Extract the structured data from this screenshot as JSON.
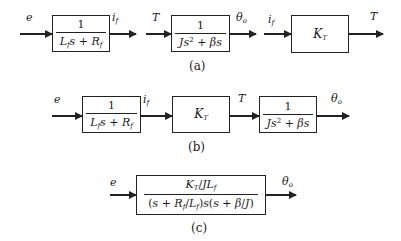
{
  "diagram": {
    "type": "block-diagram",
    "panels": [
      {
        "caption": "(a)",
        "blocks": [
          {
            "id": "a1",
            "numerator": "1",
            "denominator_html": "<i>L<sub>f</sub>s</i> + <i>R<sub>f</sub></i>",
            "input": "e",
            "output": "i_f"
          },
          {
            "id": "a2",
            "numerator": "1",
            "denominator_html": "<i>Js</i><sup>2</sup> + <i>βs</i>",
            "input": "T",
            "output": "θ_o"
          },
          {
            "id": "a3",
            "gain_html": "K<sub>T</sub>",
            "input": "i_f",
            "output": "T"
          }
        ]
      },
      {
        "caption": "(b)",
        "blocks": [
          {
            "id": "b1",
            "numerator": "1",
            "denominator_html": "<i>L<sub>f</sub>s</i> + <i>R<sub>f</sub></i>",
            "input": "e",
            "output": "i_f"
          },
          {
            "id": "b2",
            "gain_html": "K<sub>T</sub>",
            "input": "i_f",
            "output": "T"
          },
          {
            "id": "b3",
            "numerator": "1",
            "denominator_html": "<i>Js</i><sup>2</sup> + <i>βs</i>",
            "input": "T",
            "output": "θ_o"
          }
        ]
      },
      {
        "caption": "(c)",
        "blocks": [
          {
            "id": "c1",
            "numerator_html": "<i>K<sub>T</sub></i>/<i>JL<sub>f</sub></i>",
            "denominator_html": "(<i>s</i> + <i>R<sub>f</sub></i>/<i>L<sub>f</sub></i>)<i>s</i>(<i>s</i> + <i>β</i>/<i>J</i>)",
            "input": "e",
            "output": "θ_o"
          }
        ]
      }
    ]
  },
  "labels": {
    "e": "e",
    "i_f_html": "i<sub>f</sub>",
    "T": "T",
    "theta_o_html": "θ<sub>o</sub>"
  },
  "captions": {
    "a": "(a)",
    "b": "(b)",
    "c": "(c)"
  }
}
